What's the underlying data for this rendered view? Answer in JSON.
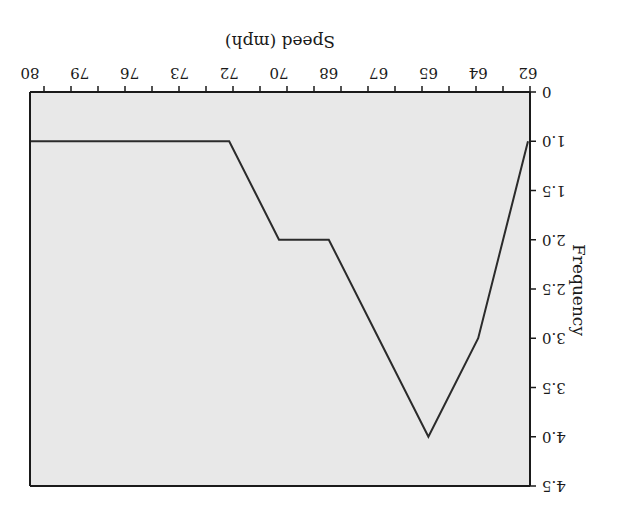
{
  "orientation": "rotated-180",
  "colors": {
    "plot_background": "#e8e8e8",
    "line": "#2b2b2b",
    "axis": "#1a1a1a",
    "page_background": "#ffffff"
  },
  "chart_data": {
    "type": "line",
    "title": "",
    "xlabel": "Speed (mph)",
    "ylabel": "Frequency",
    "categories": [
      "62",
      "64",
      "65",
      "67",
      "68",
      "70",
      "72",
      "73",
      "76",
      "79",
      "80"
    ],
    "values": [
      1.0,
      3.0,
      4.0,
      3.0,
      2.0,
      2.0,
      1.0,
      1.0,
      1.0,
      1.0,
      1.0
    ],
    "y_tick_labels": [
      "0",
      "1.0",
      "1.5",
      "2.0",
      "2.5",
      "3.0",
      "3.5",
      "4.0",
      "4.5"
    ],
    "ylim": [
      0,
      4.5
    ],
    "grid": false,
    "legend": null
  }
}
